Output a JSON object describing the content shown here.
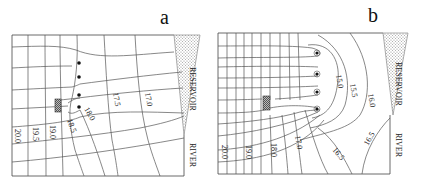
{
  "figure": {
    "panels": [
      {
        "id": "a",
        "letter": "a",
        "reservoir_label": "RESERVOIR",
        "river_label": "RIVER",
        "contour_labels": [
          "20.0",
          "19.5",
          "19.0",
          "18.5",
          "18.0",
          "17.5",
          "17.0"
        ],
        "wells": 4,
        "well_style": "plain"
      },
      {
        "id": "b",
        "letter": "b",
        "reservoir_label": "RESERVOIR",
        "river_label": "RIVER",
        "contour_labels": [
          "20.0",
          "19.0",
          "18.0",
          "17.0",
          "16.5",
          "15.0",
          "15.5",
          "16.0",
          "16.5"
        ],
        "wells": 4,
        "well_style": "circled"
      }
    ],
    "colors": {
      "line": "#555555",
      "frame": "#444444",
      "hatch": "#888888",
      "well": "#111111"
    }
  }
}
